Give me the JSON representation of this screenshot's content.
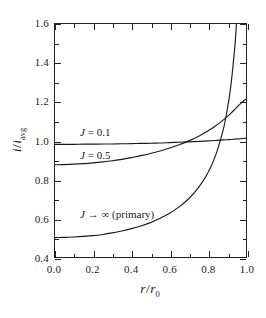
{
  "chart_data": {
    "type": "line",
    "title": "",
    "subtitle": "",
    "xlabel": "r/r_0",
    "ylabel": "i/i_avg",
    "xlim": [
      0.0,
      1.0
    ],
    "ylim": [
      0.4,
      1.6
    ],
    "grid": false,
    "legend_position": "inline-annotations",
    "tick_direction": "in",
    "frame": "box",
    "line_color": "#1a1a1a",
    "background": "#ffffff",
    "x_ticks_major": [
      "0.0",
      "0.2",
      "0.4",
      "0.6",
      "0.8",
      "1.0"
    ],
    "x_ticks_major_values": [
      0.0,
      0.2,
      0.4,
      0.6,
      0.8,
      1.0
    ],
    "x_ticks_minor_values": [
      0.1,
      0.3,
      0.5,
      0.7,
      0.9
    ],
    "y_ticks_major": [
      "0.4",
      "0.6",
      "0.8",
      "1.0",
      "1.2",
      "1.4",
      "1.6"
    ],
    "y_ticks_major_values": [
      0.4,
      0.6,
      0.8,
      1.0,
      1.2,
      1.4,
      1.6
    ],
    "y_ticks_minor_values": [
      0.5,
      0.7,
      0.9,
      1.1,
      1.3,
      1.5
    ],
    "x": [
      0.0,
      0.05,
      0.1,
      0.15,
      0.2,
      0.25,
      0.3,
      0.35,
      0.4,
      0.45,
      0.5,
      0.55,
      0.6,
      0.65,
      0.7,
      0.75,
      0.8,
      0.84,
      0.88,
      0.9,
      0.92,
      0.94,
      0.95,
      0.96,
      0.97,
      0.98,
      0.99,
      1.0
    ],
    "series": [
      {
        "name": "J = 0.1",
        "label": "J = 0.1",
        "annotation_x": 0.13,
        "annotation_y": 1.045,
        "values": [
          0.98,
          0.98,
          0.98,
          0.981,
          0.981,
          0.982,
          0.982,
          0.983,
          0.984,
          0.985,
          0.986,
          0.987,
          0.989,
          0.991,
          0.993,
          0.995,
          0.998,
          1.0,
          1.003,
          1.004,
          1.005,
          1.007,
          1.008,
          1.008,
          1.009,
          1.01,
          1.011,
          1.012
        ]
      },
      {
        "name": "J = 0.5",
        "label": "J = 0.5",
        "annotation_x": 0.13,
        "annotation_y": 0.925,
        "values": [
          0.875,
          0.876,
          0.878,
          0.881,
          0.885,
          0.89,
          0.896,
          0.903,
          0.912,
          0.922,
          0.933,
          0.946,
          0.961,
          0.978,
          0.998,
          1.021,
          1.049,
          1.075,
          1.105,
          1.122,
          1.14,
          1.159,
          1.169,
          1.179,
          1.189,
          1.198,
          1.206,
          1.212
        ]
      },
      {
        "name": "J -> infinity (primary)",
        "label": "J → ∞  (primary)",
        "annotation_x": 0.13,
        "annotation_y": 0.625,
        "formula": "0.5 / sqrt(1 - (r/r_0)^2)",
        "values": [
          0.5,
          0.501,
          0.503,
          0.506,
          0.51,
          0.516,
          0.524,
          0.534,
          0.546,
          0.56,
          0.577,
          0.599,
          0.625,
          0.658,
          0.7,
          0.756,
          0.833,
          0.921,
          1.052,
          1.147,
          1.276,
          1.467,
          1.601,
          1.786,
          2.057,
          2.513,
          3.546,
          null
        ]
      }
    ]
  },
  "axes": {
    "x_title_main": "r",
    "x_title_slash": "/",
    "x_title_den": "r",
    "x_title_sub": "0",
    "y_title_main": "i",
    "y_title_slash": "/",
    "y_title_den": "i",
    "y_title_sub": "avg"
  },
  "annotations": {
    "curve1": {
      "sym": "J",
      "text": " = 0.1"
    },
    "curve2": {
      "sym": "J",
      "text": " = 0.5"
    },
    "curve3": {
      "sym": "J",
      "text": " → ∞  (primary)"
    }
  }
}
